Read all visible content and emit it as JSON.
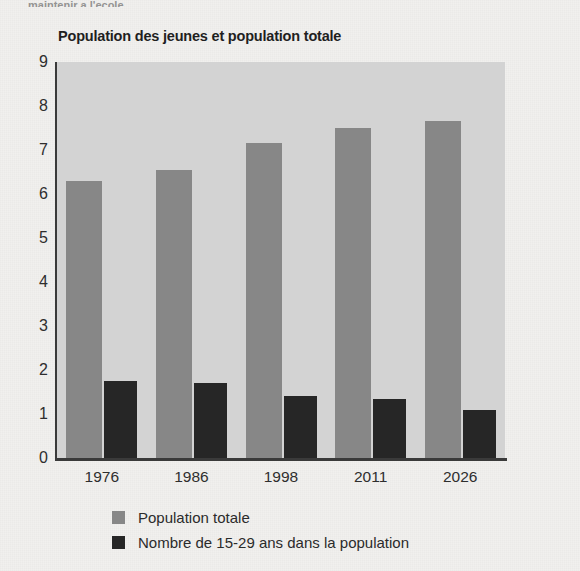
{
  "page": {
    "cutoff_text_fragment": "maintenir a l'ecole"
  },
  "chart_data": {
    "type": "bar",
    "title": "Population des jeunes et population totale",
    "xlabel": "",
    "ylabel": "",
    "ylim": [
      0,
      9
    ],
    "yticks": [
      9,
      8,
      7,
      6,
      5,
      4,
      3,
      2,
      1,
      0
    ],
    "grid": false,
    "legend_position": "bottom-left",
    "categories": [
      "1976",
      "1986",
      "1998",
      "2011",
      "2026"
    ],
    "series": [
      {
        "name": "Population totale",
        "color": "#878787",
        "values": [
          6.3,
          6.55,
          7.15,
          7.5,
          7.65
        ]
      },
      {
        "name": "Nombre de 15-29 ans dans la population",
        "color": "#262626",
        "values": [
          1.75,
          1.7,
          1.4,
          1.35,
          1.1
        ]
      }
    ],
    "colors": {
      "plot_background": "#d3d3d3",
      "page_background": "#f1f0ee",
      "axis": "#3a3a3a",
      "series_total": "#878787",
      "series_youth": "#262626"
    }
  }
}
